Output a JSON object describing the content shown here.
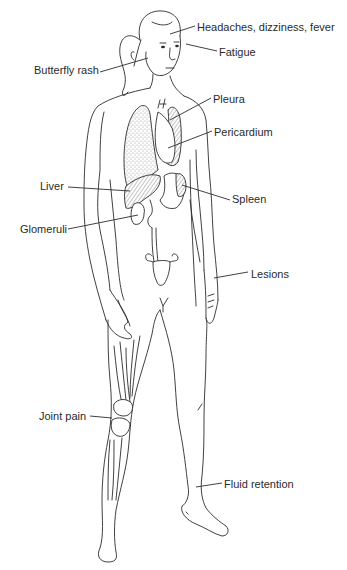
{
  "figure": {
    "style": "black line drawing on white background",
    "colors": {
      "line": "#2b2b2b",
      "text": "#2a2a2a",
      "background": "#ffffff"
    }
  },
  "labels": [
    {
      "id": "headaches",
      "text": "Headaches, dizziness, fever",
      "x": 197,
      "y": 21,
      "target": "forehead"
    },
    {
      "id": "fatigue",
      "text": "Fatigue",
      "x": 219,
      "y": 46,
      "target": "temple"
    },
    {
      "id": "butterfly-rash",
      "text": "Butterfly rash",
      "x": 34,
      "y": 64,
      "target": "cheek"
    },
    {
      "id": "pleura",
      "text": "Pleura",
      "x": 213,
      "y": 93,
      "target": "pleura"
    },
    {
      "id": "pericardium",
      "text": "Pericardium",
      "x": 214,
      "y": 126,
      "target": "heart"
    },
    {
      "id": "liver",
      "text": "Liver",
      "x": 40,
      "y": 180,
      "target": "liver"
    },
    {
      "id": "spleen",
      "text": "Spleen",
      "x": 232,
      "y": 193,
      "target": "spleen"
    },
    {
      "id": "glomeruli",
      "text": "Glomeruli",
      "x": 20,
      "y": 223,
      "target": "kidney"
    },
    {
      "id": "lesions",
      "text": "Lesions",
      "x": 251,
      "y": 268,
      "target": "forearm"
    },
    {
      "id": "joint-pain",
      "text": "Joint pain",
      "x": 39,
      "y": 410,
      "target": "knee"
    },
    {
      "id": "fluid-retention",
      "text": "Fluid retention",
      "x": 224,
      "y": 478,
      "target": "ankle"
    }
  ]
}
